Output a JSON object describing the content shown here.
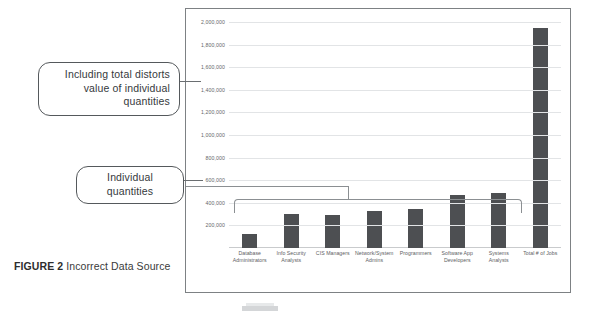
{
  "figure": {
    "label": "FIGURE 2",
    "title": " Incorrect Data Source"
  },
  "callouts": {
    "total": "Including total distorts value of individual quantities",
    "individual": "Individual quantities"
  },
  "colors": {
    "bar": "#4d4f52",
    "gridline": "#e2e4e6",
    "panel_border": "#7d8184",
    "callout_border": "#55595c",
    "text": "#3b3b3b"
  },
  "chart_data": {
    "type": "bar",
    "title": "",
    "xlabel": "",
    "ylabel": "",
    "ylim": [
      0,
      2000000
    ],
    "grid": true,
    "legend": "none",
    "yticks": [
      "2,000,000",
      "1,800,000",
      "1,600,000",
      "1,400,000",
      "1,200,000",
      "1,000,000",
      "800,000",
      "600,000",
      "400,000",
      "200,000"
    ],
    "ytick_values": [
      2000000,
      1800000,
      1600000,
      1400000,
      1200000,
      1000000,
      800000,
      600000,
      400000,
      200000
    ],
    "categories": [
      "Database Administrators",
      "Info Security Analysts",
      "CIS Managers",
      "Network/System Admins",
      "Programmers",
      "Software App Developers",
      "Systems Analysts",
      "Total # of Jobs"
    ],
    "values": [
      120000,
      300000,
      290000,
      330000,
      345000,
      470000,
      490000,
      1950000
    ]
  }
}
